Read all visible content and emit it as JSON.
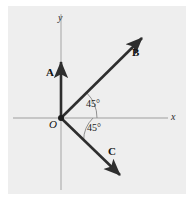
{
  "figure": {
    "name": "vector-diagram-xy-plane",
    "background_color": "#ffffff",
    "panel_color": "#eeeeee",
    "axis_color": "#b9b9b9",
    "vector_color": "#2e2e2e",
    "arc_color": "#8f8f8f",
    "label_color": "#111111"
  },
  "axes": {
    "x_label": "x",
    "y_label": "y",
    "origin_label": "O",
    "origin_px": {
      "x": 61,
      "y": 118
    },
    "x_axis_px": {
      "x1": 13,
      "y1": 118,
      "x2": 168,
      "y2": 118
    },
    "y_axis_px": {
      "x1": 61,
      "y1": 14,
      "x2": 61,
      "y2": 190
    }
  },
  "vectors": [
    {
      "label": "A",
      "direction_deg": 90,
      "tip_px": {
        "x": 61,
        "y": 60
      },
      "label_px": {
        "x": 46,
        "y": 67
      }
    },
    {
      "label": "B",
      "direction_deg": 45,
      "tip_px": {
        "x": 144,
        "y": 36
      },
      "label_px": {
        "x": 132,
        "y": 47
      }
    },
    {
      "label": "C",
      "direction_deg": -45,
      "tip_px": {
        "x": 122,
        "y": 177
      },
      "label_px": {
        "x": 108,
        "y": 146
      }
    }
  ],
  "angles": [
    {
      "label": "45°",
      "between": "x-axis and B",
      "label_px": {
        "x": 86,
        "y": 99
      }
    },
    {
      "label": "45°",
      "between": "x-axis and C",
      "label_px": {
        "x": 87,
        "y": 123
      }
    }
  ]
}
